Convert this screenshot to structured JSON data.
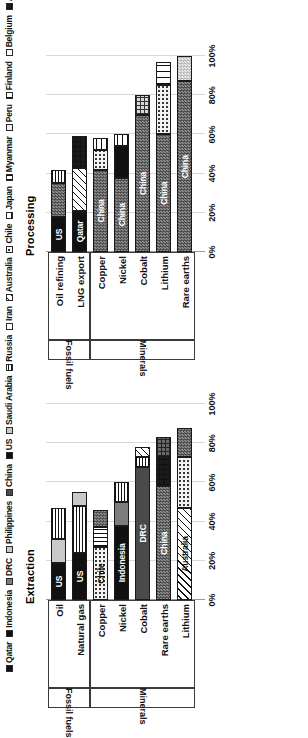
{
  "figure": {
    "panels": [
      {
        "key": "extraction",
        "title": "Extraction"
      },
      {
        "key": "processing",
        "title": "Processing"
      }
    ],
    "axis_ticks": [
      "0%",
      "20%",
      "40%",
      "60%",
      "80%",
      "100%"
    ],
    "group_labels": {
      "fossil": "Fossil fuels",
      "minerals": "Minerals"
    }
  },
  "legend": {
    "items": [
      {
        "label": "Qatar",
        "pattern": "p-black"
      },
      {
        "label": "Indonesia",
        "pattern": "p-black"
      },
      {
        "label": "DRC",
        "pattern": "p-midgray"
      },
      {
        "label": "Philippines",
        "pattern": "p-ltgray"
      },
      {
        "label": "China",
        "pattern": "p-dkgray"
      },
      {
        "label": "US",
        "pattern": "p-black"
      },
      {
        "label": "Saudi Arabia",
        "pattern": "p-ltgray"
      },
      {
        "label": "Russia",
        "pattern": "p-hlines-fine"
      },
      {
        "label": "Iran",
        "pattern": "p-white"
      },
      {
        "label": "Australia",
        "pattern": "p-diag-l"
      },
      {
        "label": "Chile",
        "pattern": "p-dots-lt"
      },
      {
        "label": "Japan",
        "pattern": "p-hlines-wide"
      },
      {
        "label": "Myanmar",
        "pattern": "p-vlines"
      },
      {
        "label": "Peru",
        "pattern": "p-vltgray"
      },
      {
        "label": "Finland",
        "pattern": "p-vlines-wide"
      },
      {
        "label": "Belgium",
        "pattern": "p-white"
      },
      {
        "label": "Argentina",
        "pattern": "p-grid-black"
      },
      {
        "label": "Malaysia",
        "pattern": "p-grid-lt"
      },
      {
        "label": "Estonia",
        "pattern": "p-checker-lt"
      }
    ]
  },
  "chart_data": [
    {
      "type": "bar",
      "title": "Extraction",
      "orientation": "vertical-stacked",
      "xlabel": "",
      "ylabel": "",
      "ylim": [
        0,
        100
      ],
      "ticks": [
        0,
        20,
        40,
        60,
        80,
        100
      ],
      "grid": true,
      "legend_position": "top",
      "groups": [
        {
          "name": "Fossil fuels",
          "categories": [
            "Oil",
            "Natural gas"
          ]
        },
        {
          "name": "Minerals",
          "categories": [
            "Copper",
            "Nickel",
            "Cobalt",
            "Rare earths",
            "Lithium"
          ]
        }
      ],
      "categories": [
        "Oil",
        "Natural gas",
        "Copper",
        "Nickel",
        "Cobalt",
        "Rare earths",
        "Lithium"
      ],
      "bars": [
        {
          "category": "Oil",
          "total": 47,
          "segments": [
            {
              "country": "US",
              "value": 19,
              "pattern": "p-black",
              "label": "US",
              "label_tone": "on-dark"
            },
            {
              "country": "Saudi Arabia",
              "value": 12,
              "pattern": "p-ltgray",
              "label": "",
              "label_tone": "on-light"
            },
            {
              "country": "Russia",
              "value": 16,
              "pattern": "p-hlines-fine",
              "label": "",
              "label_tone": "on-light"
            }
          ]
        },
        {
          "category": "Natural gas",
          "total": 55,
          "segments": [
            {
              "country": "US",
              "value": 24,
              "pattern": "p-black",
              "label": "US",
              "label_tone": "on-dark"
            },
            {
              "country": "Russia",
              "value": 24,
              "pattern": "p-hlines-fine",
              "label": "",
              "label_tone": "on-light"
            },
            {
              "country": "Iran",
              "value": 7,
              "pattern": "p-ltgray",
              "label": "",
              "label_tone": "on-light"
            }
          ]
        },
        {
          "category": "Copper",
          "total": 46,
          "segments": [
            {
              "country": "Chile",
              "value": 27,
              "pattern": "p-dots-lt",
              "label": "Chile",
              "label_tone": "on-light"
            },
            {
              "country": "Peru",
              "value": 10,
              "pattern": "p-vlines",
              "label": "",
              "label_tone": "on-light"
            },
            {
              "country": "China",
              "value": 9,
              "pattern": "p-checker-dk",
              "label": "",
              "label_tone": "on-light"
            }
          ]
        },
        {
          "category": "Nickel",
          "total": 60,
          "segments": [
            {
              "country": "Indonesia",
              "value": 38,
              "pattern": "p-black",
              "label": "Indonesia",
              "label_tone": "on-dark"
            },
            {
              "country": "Philippines",
              "value": 12,
              "pattern": "p-midgray",
              "label": "",
              "label_tone": "on-light"
            },
            {
              "country": "Russia",
              "value": 10,
              "pattern": "p-hlines-fine",
              "label": "",
              "label_tone": "on-light"
            }
          ]
        },
        {
          "category": "Cobalt",
          "total": 78,
          "segments": [
            {
              "country": "DRC",
              "value": 68,
              "pattern": "p-dkgray",
              "label": "DRC",
              "label_tone": "on-dark"
            },
            {
              "country": "Russia",
              "value": 5,
              "pattern": "p-hlines-fine",
              "label": "",
              "label_tone": "on-light"
            },
            {
              "country": "Australia",
              "value": 5,
              "pattern": "p-diag-l",
              "label": "",
              "label_tone": "on-light"
            }
          ]
        },
        {
          "category": "Rare earths",
          "total": 83,
          "segments": [
            {
              "country": "China",
              "value": 58,
              "pattern": "p-checker-dk",
              "label": "China",
              "label_tone": "on-dark"
            },
            {
              "country": "US",
              "value": 15,
              "pattern": "p-grid-black",
              "label": "",
              "label_tone": "on-dark"
            },
            {
              "country": "Australia",
              "value": 10,
              "pattern": "p-grid-dk",
              "label": "",
              "label_tone": "on-light"
            }
          ]
        },
        {
          "category": "Lithium",
          "total": 88,
          "segments": [
            {
              "country": "Australia",
              "value": 47,
              "pattern": "p-diag-l",
              "label": "Australia",
              "label_tone": "on-light"
            },
            {
              "country": "Chile",
              "value": 26,
              "pattern": "p-dots-lt",
              "label": "",
              "label_tone": "on-light"
            },
            {
              "country": "China",
              "value": 15,
              "pattern": "p-checker-dk",
              "label": "",
              "label_tone": "on-light"
            }
          ]
        }
      ]
    },
    {
      "type": "bar",
      "title": "Processing",
      "orientation": "vertical-stacked",
      "xlabel": "",
      "ylabel": "",
      "ylim": [
        0,
        100
      ],
      "ticks": [
        0,
        20,
        40,
        60,
        80,
        100
      ],
      "grid": true,
      "legend_position": "top",
      "groups": [
        {
          "name": "Fossil fuels",
          "categories": [
            "Oil refining",
            "LNG export"
          ]
        },
        {
          "name": "Minerals",
          "categories": [
            "Copper",
            "Nickel",
            "Cobalt",
            "Lithium",
            "Rare earths"
          ]
        }
      ],
      "categories": [
        "Oil refining",
        "LNG export",
        "Copper",
        "Nickel",
        "Cobalt",
        "Lithium",
        "Rare earths"
      ],
      "bars": [
        {
          "category": "Oil refining",
          "total": 42,
          "segments": [
            {
              "country": "US",
              "value": 18,
              "pattern": "p-black",
              "label": "US",
              "label_tone": "on-dark"
            },
            {
              "country": "China",
              "value": 17,
              "pattern": "p-checker-dk",
              "label": "",
              "label_tone": "on-light"
            },
            {
              "country": "Russia",
              "value": 7,
              "pattern": "p-hlines-fine",
              "label": "",
              "label_tone": "on-light"
            }
          ]
        },
        {
          "category": "LNG export",
          "total": 59,
          "segments": [
            {
              "country": "Qatar",
              "value": 21,
              "pattern": "p-black",
              "label": "Qatar",
              "label_tone": "on-dark"
            },
            {
              "country": "Australia",
              "value": 22,
              "pattern": "p-diag-l",
              "label": "",
              "label_tone": "on-light"
            },
            {
              "country": "US",
              "value": 16,
              "pattern": "p-grid-black",
              "label": "",
              "label_tone": "on-dark"
            }
          ]
        },
        {
          "category": "Copper",
          "total": 58,
          "segments": [
            {
              "country": "China",
              "value": 42,
              "pattern": "p-checker-dk",
              "label": "China",
              "label_tone": "on-dark"
            },
            {
              "country": "Chile",
              "value": 10,
              "pattern": "p-dots-lt",
              "label": "",
              "label_tone": "on-light"
            },
            {
              "country": "Japan",
              "value": 6,
              "pattern": "p-hlines-wide",
              "label": "",
              "label_tone": "on-light"
            }
          ]
        },
        {
          "category": "Nickel",
          "total": 60,
          "segments": [
            {
              "country": "China",
              "value": 38,
              "pattern": "p-checker-dk",
              "label": "China",
              "label_tone": "on-dark"
            },
            {
              "country": "Indonesia",
              "value": 16,
              "pattern": "p-black",
              "label": "",
              "label_tone": "on-dark"
            },
            {
              "country": "Japan",
              "value": 6,
              "pattern": "p-hlines-wide",
              "label": "",
              "label_tone": "on-light"
            }
          ]
        },
        {
          "category": "Cobalt",
          "total": 80,
          "segments": [
            {
              "country": "China",
              "value": 70,
              "pattern": "p-checker-dk",
              "label": "China",
              "label_tone": "on-dark"
            },
            {
              "country": "Finland",
              "value": 10,
              "pattern": "p-grid-lt",
              "label": "",
              "label_tone": "on-light"
            }
          ]
        },
        {
          "category": "Lithium",
          "total": 97,
          "segments": [
            {
              "country": "China",
              "value": 60,
              "pattern": "p-checker-dk",
              "label": "China",
              "label_tone": "on-dark"
            },
            {
              "country": "Chile",
              "value": 25,
              "pattern": "p-dots-lt",
              "label": "",
              "label_tone": "on-light"
            },
            {
              "country": "Argentina",
              "value": 12,
              "pattern": "p-vlines-wide",
              "label": "",
              "label_tone": "on-light"
            }
          ]
        },
        {
          "category": "Rare earths",
          "total": 100,
          "segments": [
            {
              "country": "China",
              "value": 87,
              "pattern": "p-checker-dk",
              "label": "China",
              "label_tone": "on-dark"
            },
            {
              "country": "Malaysia",
              "value": 13,
              "pattern": "p-checker-lt",
              "label": "",
              "label_tone": "on-light"
            }
          ]
        }
      ]
    }
  ]
}
